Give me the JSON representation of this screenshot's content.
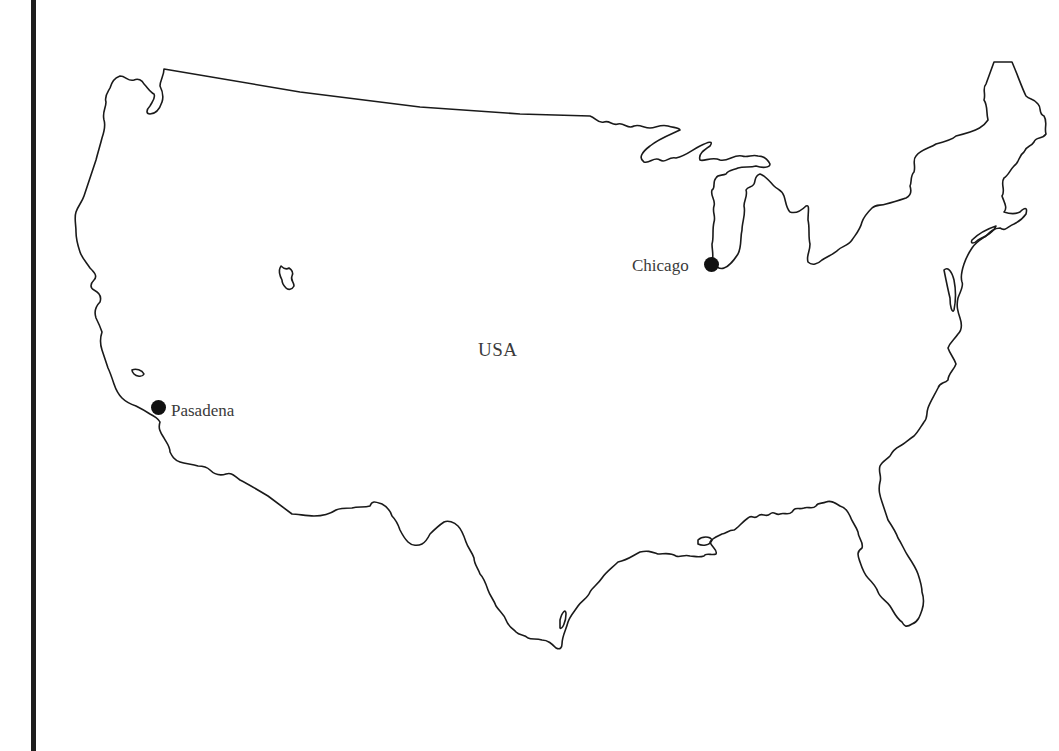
{
  "map": {
    "country_label": "USA",
    "cities": [
      {
        "name": "Chicago",
        "label_side": "left"
      },
      {
        "name": "Pasadena",
        "label_side": "right"
      }
    ],
    "colors": {
      "outline": "#1a1a1a",
      "marker": "#111111",
      "label": "#3a3a3a",
      "frame_bar": "#1e1e1e",
      "background": "#ffffff"
    }
  }
}
